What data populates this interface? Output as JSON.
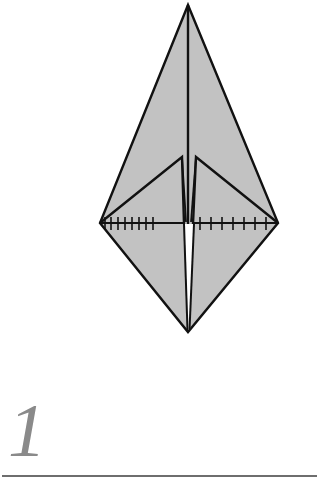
{
  "diagram": {
    "step_number": "1",
    "colors": {
      "paper_fill": "#c2c2c2",
      "outline": "#111111",
      "gap": "#ffffff",
      "step_number": "#8a8a8a",
      "rule": "#6e6e6e"
    },
    "shape": "elongated diamond with two inner flaps",
    "marks": {
      "left_ticks": 8,
      "right_ticks": 7,
      "type": "crease tick marks along horizontal fold line"
    }
  }
}
